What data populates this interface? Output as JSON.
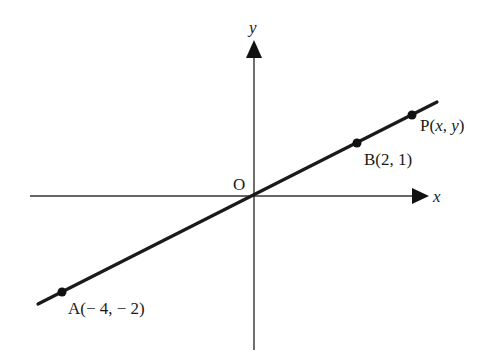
{
  "diagram": {
    "type": "coordinate-plane-line",
    "axes": {
      "x_label": "x",
      "y_label": "y",
      "origin_label": "O"
    },
    "line": {
      "description": "Straight line through origin, A, B and P",
      "color": "#1a1a1a"
    },
    "points": [
      {
        "id": "A",
        "label": "A(− 4, − 2)",
        "x": -4,
        "y": -2
      },
      {
        "id": "B",
        "label": "B(2, 1)",
        "x": 2,
        "y": 1
      },
      {
        "id": "P",
        "label_prefix": "P(",
        "label_x": "x",
        "label_sep": ", ",
        "label_y": "y",
        "label_suffix": ")"
      }
    ]
  }
}
